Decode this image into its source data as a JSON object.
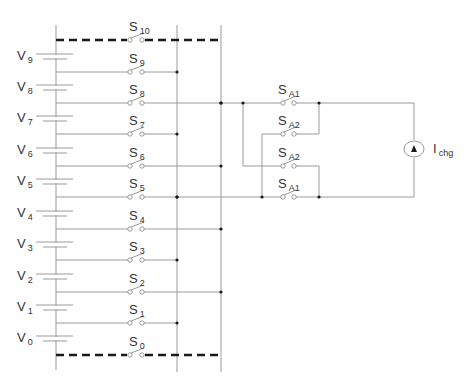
{
  "colors": {
    "wire": "#9a9a9a",
    "dashed_bus": "#1a1a1a",
    "node": "#1a1a1a",
    "text": "#333333",
    "background": "#ffffff"
  },
  "geometry": {
    "left_rail_x": 56,
    "rail_top_y": 25,
    "rail_bottom_y": 371,
    "bus1_x": 177,
    "bus2_x": 221,
    "switch_left_x": 130,
    "switch_right_x": 142
  },
  "cells": [
    {
      "label": "V",
      "sub": "9",
      "y_long": 54,
      "y_short": 59
    },
    {
      "label": "V",
      "sub": "8",
      "y_long": 85,
      "y_short": 90
    },
    {
      "label": "V",
      "sub": "7",
      "y_long": 116,
      "y_short": 121
    },
    {
      "label": "V",
      "sub": "6",
      "y_long": 148,
      "y_short": 153
    },
    {
      "label": "V",
      "sub": "5",
      "y_long": 179,
      "y_short": 184
    },
    {
      "label": "V",
      "sub": "4",
      "y_long": 211,
      "y_short": 216
    },
    {
      "label": "V",
      "sub": "3",
      "y_long": 242,
      "y_short": 247
    },
    {
      "label": "V",
      "sub": "2",
      "y_long": 274,
      "y_short": 279
    },
    {
      "label": "V",
      "sub": "1",
      "y_long": 305,
      "y_short": 310
    },
    {
      "label": "V",
      "sub": "0",
      "y_long": 336,
      "y_short": 341
    }
  ],
  "switches": [
    {
      "label": "S",
      "sub": "10",
      "y": 40,
      "bus": "both",
      "dashed": true
    },
    {
      "label": "S",
      "sub": "9",
      "y": 72,
      "bus": 1,
      "dashed": false
    },
    {
      "label": "S",
      "sub": "8",
      "y": 103,
      "bus": 2,
      "dashed": false,
      "extends_right": true
    },
    {
      "label": "S",
      "sub": "7",
      "y": 134,
      "bus": 1,
      "dashed": false
    },
    {
      "label": "S",
      "sub": "6",
      "y": 166,
      "bus": 2,
      "dashed": false
    },
    {
      "label": "S",
      "sub": "5",
      "y": 197,
      "bus": 1,
      "dashed": false,
      "extends_right": true
    },
    {
      "label": "S",
      "sub": "4",
      "y": 229,
      "bus": 2,
      "dashed": false
    },
    {
      "label": "S",
      "sub": "3",
      "y": 260,
      "bus": 1,
      "dashed": false
    },
    {
      "label": "S",
      "sub": "2",
      "y": 292,
      "bus": 2,
      "dashed": false
    },
    {
      "label": "S",
      "sub": "1",
      "y": 323,
      "bus": 1,
      "dashed": false
    },
    {
      "label": "S",
      "sub": "0",
      "y": 355,
      "bus": "both",
      "dashed": true
    }
  ],
  "polarity_switches": [
    {
      "label": "S",
      "sub": "A1",
      "y": 103
    },
    {
      "label": "S",
      "sub": "A2",
      "y": 134
    },
    {
      "label": "S",
      "sub": "A2",
      "y": 166
    },
    {
      "label": "S",
      "sub": "A1",
      "y": 197
    }
  ],
  "current_source": {
    "label": "I",
    "sub": "chg",
    "cx": 414,
    "cy": 149,
    "r": 9,
    "direction": "up"
  }
}
